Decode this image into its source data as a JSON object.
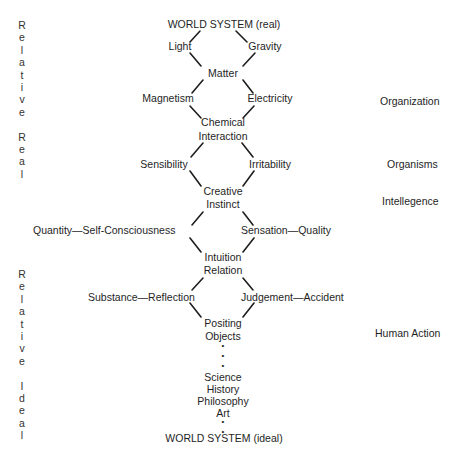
{
  "diagram": {
    "top": "WORLD SYSTEM (real)",
    "bottom": "WORLD SYSTEM (ideal)",
    "diamonds": [
      {
        "left": "Light",
        "right": "Gravity",
        "bottom": "Matter"
      },
      {
        "left": "Magnetism",
        "right": "Electricity",
        "bottom_line1": "Chemical",
        "bottom_line2": "Interaction"
      },
      {
        "left": "Sensibility",
        "right": "Irritability",
        "bottom_line1": "Creative",
        "bottom_line2": "Instinct"
      },
      {
        "left": "Quantity—Self-Consciousness",
        "right": "Sensation—Quality",
        "bottom_line1": "Intuition",
        "bottom_line2": "Relation"
      },
      {
        "left": "Substance—Reflection",
        "right": "Judgement—Accident",
        "bottom_line1": "Positing",
        "bottom_line2": "Objects"
      }
    ],
    "chain": [
      "Science",
      "History",
      "Philosophy",
      "Art"
    ],
    "ellipsis_dot": "•"
  },
  "left_labels": {
    "upper": [
      "R",
      "e",
      "l",
      "a",
      "t",
      "i",
      "v",
      "e",
      "",
      "R",
      "e",
      "a",
      "l"
    ],
    "lower": [
      "R",
      "e",
      "l",
      "a",
      "t",
      "i",
      "v",
      "e",
      "",
      "I",
      "d",
      "e",
      "a",
      "l"
    ]
  },
  "right_labels": {
    "organization": "Organization",
    "organisms": "Organisms",
    "intellegence": "Intellegence",
    "human_action": "Human Action"
  }
}
